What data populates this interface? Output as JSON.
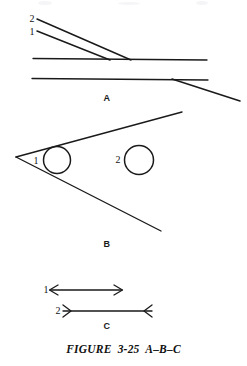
{
  "figure": {
    "caption": "FIGURE  3-25  A–B–C",
    "caption_x": 0,
    "caption_y": 343,
    "background_color": "#ffffff",
    "ink_color": "#1a1a1a",
    "width": 247,
    "height": 366
  },
  "panels": [
    {
      "id": "A",
      "letter": "A",
      "letter_x": 99,
      "letter_y": 94,
      "description": "Two converging diagonal lines meeting a horizontal line; second horizontal line with diagonal branch descending right"
    },
    {
      "id": "B",
      "letter": "B",
      "letter_x": 99,
      "letter_y": 240,
      "description": "Wedge opening to the right with inscribed circle 1 at apex and free circle 2 to the right"
    },
    {
      "id": "C",
      "letter": "C",
      "letter_x": 99,
      "letter_y": 322,
      "description": "Two dimension lines: line 1 with outward arrowheads, line 2 with inward arrowheads"
    }
  ],
  "labels": [
    {
      "name": "panel-a-label-2",
      "text": "2",
      "x": 26,
      "y": 14,
      "panel": "A"
    },
    {
      "name": "panel-a-label-1",
      "text": "1",
      "x": 26,
      "y": 27,
      "panel": "A"
    },
    {
      "name": "panel-b-label-1",
      "text": "1",
      "x": 30,
      "y": 156,
      "panel": "B"
    },
    {
      "name": "panel-b-label-2",
      "text": "2",
      "x": 112,
      "y": 155,
      "panel": "B"
    },
    {
      "name": "panel-c-label-1",
      "text": "1",
      "x": 40,
      "y": 285,
      "panel": "C"
    },
    {
      "name": "panel-c-label-2",
      "text": "2",
      "x": 52,
      "y": 306,
      "panel": "C"
    }
  ],
  "geometry": {
    "panel_a": {
      "ray_2": {
        "x1": 37,
        "y1": 19,
        "x2": 131,
        "y2": 60
      },
      "ray_1": {
        "x1": 37,
        "y1": 31,
        "x2": 110,
        "y2": 60
      },
      "horizontal_upper": {
        "x1": 33,
        "y1": 58,
        "x2": 207,
        "y2": 60
      },
      "horizontal_lower": {
        "x1": 32,
        "y1": 78,
        "x2": 208,
        "y2": 80
      },
      "branch_lower": {
        "x1": 172,
        "y1": 79,
        "x2": 240,
        "y2": 101
      }
    },
    "panel_b": {
      "wedge_apex": {
        "x": 16,
        "y": 157
      },
      "wedge_upper": {
        "x1": 16,
        "y1": 157,
        "x2": 182,
        "y2": 112
      },
      "wedge_lower": {
        "x1": 16,
        "y1": 157,
        "x2": 161,
        "y2": 231
      },
      "circle_1": {
        "cx": 57,
        "cy": 160,
        "r": 13.5
      },
      "circle_2": {
        "cx": 139,
        "cy": 160,
        "r": 14.5
      }
    },
    "panel_c": {
      "line_1": {
        "x1": 50,
        "y1": 290,
        "x2": 122,
        "y2": 290,
        "arrowheads": "outward"
      },
      "line_2": {
        "x1": 63,
        "y1": 311,
        "x2": 152,
        "y2": 311,
        "arrowheads": "inward"
      }
    }
  }
}
